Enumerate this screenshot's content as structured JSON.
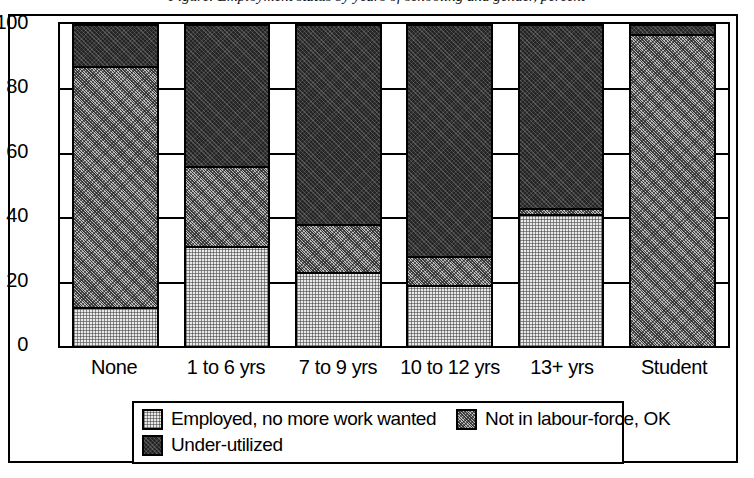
{
  "figure": {
    "title_partial": "Figure: Employment status by years of schooling and gender, percent"
  },
  "chart_data": {
    "type": "bar",
    "stacked": true,
    "title": "",
    "xlabel": "",
    "ylabel": "",
    "ylim": [
      0,
      100
    ],
    "yticks": [
      0,
      20,
      40,
      60,
      80,
      100
    ],
    "grid": true,
    "legend_position": "bottom",
    "categories": [
      "None",
      "1 to 6 yrs",
      "7 to 9 yrs",
      "10 to 12 yrs",
      "13+ yrs",
      "Student"
    ],
    "series": [
      {
        "name": "Employed, no more work wanted",
        "color": "#e9e9e9",
        "values": [
          12,
          31,
          23,
          19,
          41,
          0
        ]
      },
      {
        "name": "Not in labour-force, OK",
        "color": "#bdbdbd",
        "values": [
          75,
          25,
          15,
          9,
          2,
          97
        ]
      },
      {
        "name": "Under-utilized",
        "color": "#242424",
        "values": [
          13,
          44,
          62,
          72,
          57,
          3
        ]
      }
    ],
    "cumulative_tops": [
      [
        12,
        87,
        100
      ],
      [
        31,
        56,
        100
      ],
      [
        23,
        38,
        100
      ],
      [
        19,
        28,
        100
      ],
      [
        41,
        43,
        100
      ],
      [
        0,
        97,
        100
      ]
    ]
  },
  "axis": {
    "ytick_labels": [
      "100",
      "80",
      "60",
      "40",
      "20",
      "0"
    ]
  },
  "legend": {
    "items": [
      {
        "label": "Employed, no more work wanted",
        "swatch": "light"
      },
      {
        "label": "Not in labour-force, OK",
        "swatch": "medium"
      },
      {
        "label": "Under-utilized",
        "swatch": "dark"
      }
    ]
  }
}
